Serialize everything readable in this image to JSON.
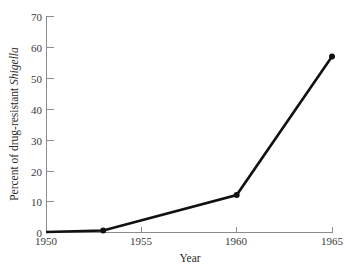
{
  "chart_data": {
    "type": "line",
    "title": "",
    "subtitle": "",
    "xlabel": "Year",
    "ylabel_plain": "Percent of drug-resistant Shigella",
    "ylabel_prefix": "Percent of drug-resistant ",
    "ylabel_italic": "Shigella",
    "x": [
      1950,
      1953,
      1960,
      1965
    ],
    "values": [
      0,
      0.5,
      12,
      57
    ],
    "series": [
      {
        "name": "Percent of drug-resistant Shigella",
        "values": [
          0,
          0.5,
          12,
          57
        ]
      }
    ],
    "points": [
      {
        "x": 1950,
        "y": 0,
        "marker": false
      },
      {
        "x": 1953,
        "y": 0.5,
        "marker": true
      },
      {
        "x": 1960,
        "y": 12,
        "marker": true
      },
      {
        "x": 1965,
        "y": 57,
        "marker": true
      }
    ],
    "xlim": [
      1950,
      1965
    ],
    "ylim": [
      0,
      70
    ],
    "xticks": [
      1950,
      1955,
      1960,
      1965
    ],
    "xtick_labels": [
      "1950",
      "1955",
      "1960",
      "1965"
    ],
    "yticks": [
      0,
      10,
      20,
      30,
      40,
      50,
      60,
      70
    ],
    "ytick_labels": [
      "0",
      "10",
      "20",
      "30",
      "40",
      "50",
      "60",
      "70"
    ],
    "grid": false,
    "legend": false,
    "legend_position": "none",
    "line_color": "#111111",
    "marker_color": "#111111",
    "axis_color": "#8c8c8c",
    "background_color": "#ffffff"
  },
  "axis": {
    "y_tick_0": "0",
    "y_tick_1": "10",
    "y_tick_2": "20",
    "y_tick_3": "30",
    "y_tick_4": "40",
    "y_tick_5": "50",
    "y_tick_6": "60",
    "y_tick_7": "70",
    "x_tick_0": "1950",
    "x_tick_1": "1955",
    "x_tick_2": "1960",
    "x_tick_3": "1965"
  }
}
